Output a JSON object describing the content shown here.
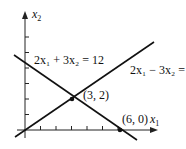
{
  "diagram": {
    "axes": {
      "x_label": "x",
      "x_sub": "1",
      "y_label": "x",
      "y_sub": "2"
    },
    "lines": [
      {
        "name": "constraint-1",
        "equation": "2x₁ + 3x₂ = 12",
        "a1": 2,
        "a2": 3,
        "rhs": 12
      },
      {
        "name": "constraint-2",
        "equation": "2x₁ − 3x₂ = 0",
        "a1": 2,
        "a2": -3,
        "rhs": 0
      }
    ],
    "points": [
      {
        "label": "(3, 2)",
        "x": 3,
        "y": 2
      },
      {
        "label": "(6, 0)",
        "x": 6,
        "y": 0
      }
    ],
    "x_ticks": [
      1,
      2,
      3,
      4,
      5,
      6
    ],
    "y_ticks": [
      1,
      2,
      3,
      4,
      5,
      6
    ]
  }
}
